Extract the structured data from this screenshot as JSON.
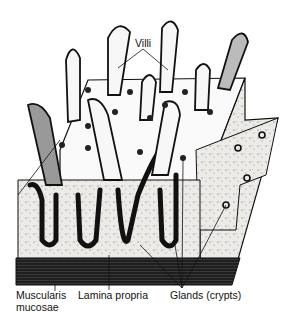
{
  "diagram": {
    "labels": {
      "villi": "Villi",
      "muscularis_mucosae_line1": "Muscularis",
      "muscularis_mucosae_line2": "mucosae",
      "lamina_propria": "Lamina propria",
      "glands": "Glands (crypts)"
    },
    "colors": {
      "ink": "#111111",
      "background": "#ffffff",
      "tissue_fill": "#e9e9e6",
      "muscle_band": "#2a2a2a"
    }
  }
}
